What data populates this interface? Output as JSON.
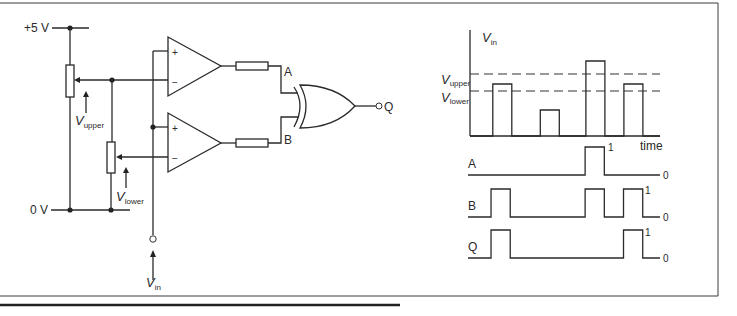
{
  "circuit": {
    "supply_label": "+5 V",
    "ground_label": "0 V",
    "v_upper": {
      "symbol": "V",
      "subscript": "upper"
    },
    "v_lower": {
      "symbol": "V",
      "subscript": "lower"
    },
    "v_in": {
      "symbol": "V",
      "subscript": "in"
    },
    "opamp_plus": "+",
    "opamp_minus": "−",
    "node_a": "A",
    "node_b": "B",
    "output": "Q",
    "gate_type": "XOR"
  },
  "timing": {
    "vin_axis": {
      "symbol": "V",
      "subscript": "in"
    },
    "time_label": "time",
    "threshold_upper": {
      "symbol": "V",
      "subscript": "upper"
    },
    "threshold_lower": {
      "symbol": "V",
      "subscript": "lower"
    },
    "high_label": "1",
    "low_label": "0",
    "traces": [
      {
        "name": "A",
        "label": "A"
      },
      {
        "name": "B",
        "label": "B"
      },
      {
        "name": "Q",
        "label": "Q"
      }
    ]
  },
  "chart_data": {
    "type": "line",
    "title": "",
    "xlabel": "time",
    "ylabel": "Vin",
    "x_segments": [
      "t0",
      "t1",
      "t2",
      "t3",
      "t4",
      "t5",
      "t6",
      "t7",
      "t8",
      "t9",
      "t10"
    ],
    "thresholds": {
      "V_upper": 0.62,
      "V_lower": 0.45
    },
    "series": [
      {
        "name": "Vin",
        "pulses": [
          {
            "start": 0.12,
            "end": 0.22,
            "level": 0.52
          },
          {
            "start": 0.37,
            "end": 0.47,
            "level": 0.26
          },
          {
            "start": 0.61,
            "end": 0.71,
            "level": 0.75
          },
          {
            "start": 0.81,
            "end": 0.91,
            "level": 0.52
          }
        ]
      },
      {
        "name": "A",
        "pulses": [
          {
            "start": 0.61,
            "end": 0.71,
            "level": 1
          }
        ]
      },
      {
        "name": "B",
        "pulses": [
          {
            "start": 0.12,
            "end": 0.22,
            "level": 1
          },
          {
            "start": 0.61,
            "end": 0.71,
            "level": 1
          },
          {
            "start": 0.81,
            "end": 0.91,
            "level": 1
          }
        ]
      },
      {
        "name": "Q",
        "pulses": [
          {
            "start": 0.12,
            "end": 0.22,
            "level": 1
          },
          {
            "start": 0.81,
            "end": 0.91,
            "level": 1
          }
        ]
      }
    ]
  }
}
